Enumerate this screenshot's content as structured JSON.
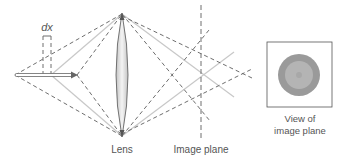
{
  "diagram": {
    "labels": {
      "dx": "dx",
      "lens": "Lens",
      "image_plane": "Image plane",
      "view_line1": "View of",
      "view_line2": "image plane"
    },
    "colors": {
      "solid_ray": "#c8c8c8",
      "dashed_ray": "#6e6e6e",
      "lens_fill": "#d9d9d9",
      "lens_stroke": "#555555",
      "outer_disc": "#9a9a9a",
      "inner_disc": "#b4b4b4",
      "text": "#555555"
    },
    "elements": {
      "object_arrow": {
        "x1": 15,
        "x2": 77,
        "y": 75
      },
      "dx_marks": {
        "x_left": 43,
        "x_right": 51
      },
      "lens": {
        "x": 122,
        "top": 13,
        "bottom": 137
      },
      "image_plane_x": 201,
      "solid_focus": {
        "x": 201,
        "y": 75
      },
      "dashed_focus_near": {
        "x": 170,
        "y": 75
      },
      "dashed_focus_far": {
        "x": 243,
        "y": 73
      },
      "view_box": {
        "x": 267,
        "y": 42,
        "w": 65,
        "h": 65
      }
    }
  }
}
